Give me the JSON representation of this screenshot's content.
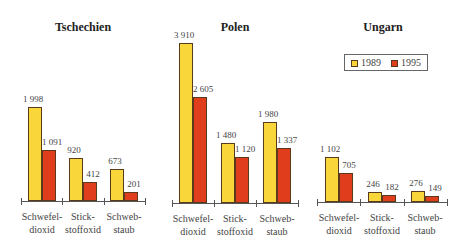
{
  "chart_data": [
    {
      "type": "bar",
      "title": "Tschechien",
      "categories": [
        "Schwefel-\ndioxid",
        "Stick-\nstoffoxid",
        "Schweb-\nstaub"
      ],
      "series": [
        {
          "name": "1989",
          "values": [
            1998,
            920,
            673
          ],
          "labels": [
            "1 998",
            "920",
            "673"
          ],
          "color": "#f9d73a"
        },
        {
          "name": "1995",
          "values": [
            1091,
            412,
            201
          ],
          "labels": [
            "1 091",
            "412",
            "201"
          ],
          "color": "#df3d1c"
        }
      ]
    },
    {
      "type": "bar",
      "title": "Polen",
      "categories": [
        "Schwefel-\ndioxid",
        "Stick-\nstoffoxid",
        "Schweb-\nstaub"
      ],
      "series": [
        {
          "name": "1989",
          "values": [
            3910,
            1480,
            1980
          ],
          "labels": [
            "3 910",
            "1 480",
            "1 980"
          ],
          "color": "#f9d73a"
        },
        {
          "name": "1995",
          "values": [
            2605,
            1120,
            1337
          ],
          "labels": [
            "2 605",
            "1 120",
            "1 337"
          ],
          "color": "#df3d1c"
        }
      ]
    },
    {
      "type": "bar",
      "title": "Ungarn",
      "categories": [
        "Schwefel-\ndioxid",
        "Stick-\nstoffoxid",
        "Schweb-\nstaub"
      ],
      "series": [
        {
          "name": "1989",
          "values": [
            1102,
            246,
            276
          ],
          "labels": [
            "1 102",
            "246",
            "276"
          ],
          "color": "#f9d73a"
        },
        {
          "name": "1995",
          "values": [
            705,
            182,
            149
          ],
          "labels": [
            "705",
            "182",
            "149"
          ],
          "color": "#df3d1c"
        }
      ]
    }
  ],
  "legend": {
    "items": [
      {
        "label": "1989",
        "color": "#f9d73a"
      },
      {
        "label": "1995",
        "color": "#df3d1c"
      }
    ]
  }
}
